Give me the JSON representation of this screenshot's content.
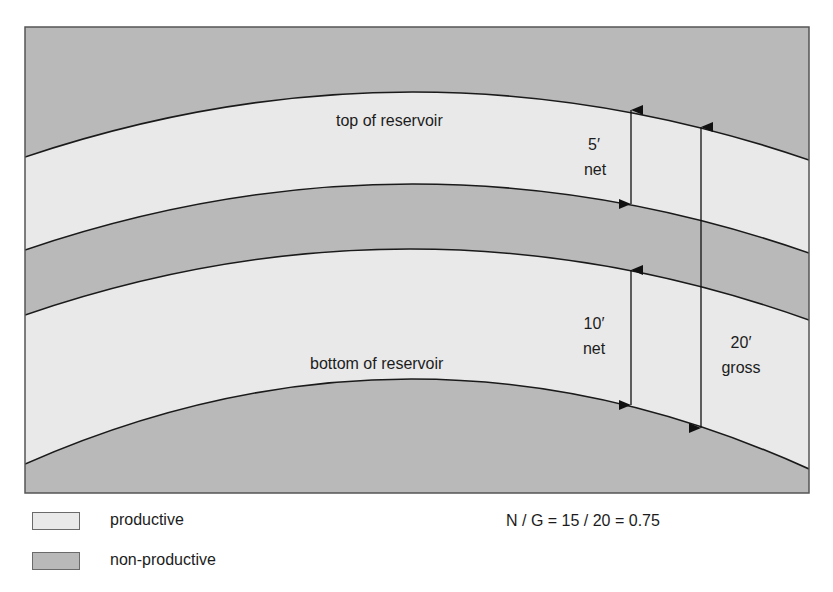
{
  "diagram": {
    "title": "",
    "labels": {
      "top_of_reservoir": "top of reservoir",
      "bottom_of_reservoir": "bottom of reservoir",
      "upper_net_value": "5′",
      "upper_net_word": "net",
      "lower_net_value": "10′",
      "lower_net_word": "net",
      "gross_value": "20′",
      "gross_word": "gross"
    },
    "formula": "N / G = 15 / 20 = 0.75",
    "layers": [
      {
        "name": "overburden",
        "type": "non-productive"
      },
      {
        "name": "upper sand",
        "type": "productive",
        "thickness": "5′ net"
      },
      {
        "name": "shale break",
        "type": "non-productive"
      },
      {
        "name": "lower sand",
        "type": "productive",
        "thickness": "10′ net"
      },
      {
        "name": "underburden",
        "type": "non-productive"
      }
    ],
    "measurements": {
      "net_upper_ft": 5,
      "net_lower_ft": 10,
      "net_total_ft": 15,
      "gross_ft": 20,
      "net_to_gross": 0.75
    }
  },
  "legend": {
    "items": [
      {
        "label": "productive",
        "color": "#e9e9e9"
      },
      {
        "label": "non-productive",
        "color": "#b9b9b9"
      }
    ]
  },
  "colors": {
    "productive": "#e9e9e9",
    "non_productive": "#b9b9b9",
    "line": "#1a1a1a",
    "frame": "#555555"
  }
}
